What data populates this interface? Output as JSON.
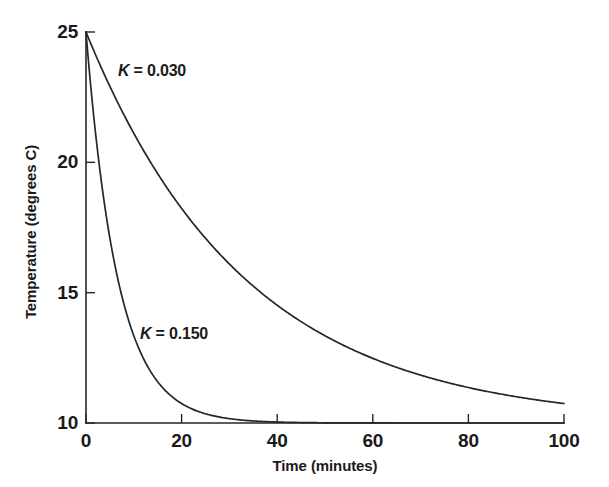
{
  "chart_data": {
    "type": "line",
    "title": "",
    "subtitle": "",
    "xlabel": "Time (minutes)",
    "ylabel": "Temperature (degrees C)",
    "xlim": [
      0,
      100
    ],
    "ylim": [
      10,
      25
    ],
    "xticks": [
      "0",
      "20",
      "40",
      "60",
      "80",
      "100"
    ],
    "xtick_values": [
      0,
      20,
      40,
      60,
      80,
      100
    ],
    "yticks": [
      "10",
      "15",
      "20",
      "25"
    ],
    "ytick_values": [
      10,
      15,
      20,
      25
    ],
    "grid": false,
    "legend_position": "inline-annotation",
    "model": "T = 10 + 15 * exp(-K * t)",
    "ambient_temperature": 10,
    "initial_temperature": 25,
    "series": [
      {
        "name": "K = 0.030",
        "k": 0.03,
        "color": "#262626",
        "annotation_label_prefix": "K",
        "annotation_label_rest": " = 0.030",
        "x": [
          0,
          5,
          10,
          15,
          20,
          25,
          30,
          35,
          40,
          45,
          50,
          55,
          60,
          65,
          70,
          75,
          80,
          85,
          90,
          95,
          100
        ],
        "values": [
          25.0,
          22.91,
          21.11,
          19.56,
          18.23,
          17.09,
          16.1,
          15.25,
          14.52,
          13.89,
          13.35,
          12.88,
          12.48,
          12.13,
          11.83,
          11.58,
          11.36,
          11.17,
          11.0,
          10.87,
          10.75
        ]
      },
      {
        "name": "K = 0.150",
        "k": 0.15,
        "color": "#262626",
        "annotation_label_prefix": "K",
        "annotation_label_rest": " = 0.150",
        "x": [
          0,
          2,
          4,
          6,
          8,
          10,
          12,
          14,
          16,
          18,
          20,
          25,
          30,
          35,
          40,
          50,
          60,
          70,
          80,
          90,
          100
        ],
        "values": [
          25.0,
          21.11,
          18.23,
          16.1,
          14.52,
          13.35,
          12.48,
          11.83,
          11.36,
          11.0,
          10.75,
          10.35,
          10.17,
          10.08,
          10.04,
          10.01,
          10.0,
          10.0,
          10.0,
          10.0,
          10.0
        ]
      }
    ],
    "annotations": [
      {
        "text": "K = 0.030",
        "x_px": 118,
        "y_px": 62
      },
      {
        "text": "K = 0.150",
        "x_px": 140,
        "y_px": 325
      }
    ],
    "colors": {
      "background": "#ffffff",
      "axis": "#262626",
      "text": "#1a1a1a",
      "curve": "#262626"
    }
  }
}
